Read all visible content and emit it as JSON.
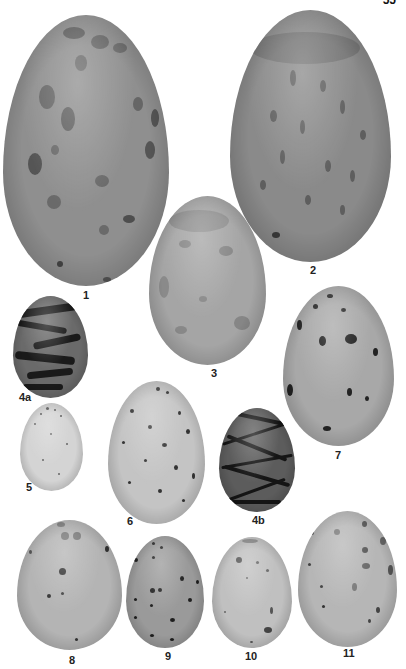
{
  "page": {
    "number_fragment": "55",
    "background": "#ffffff"
  },
  "eggs": [
    {
      "id": "1",
      "label": "1",
      "ground": "#8f8f8f",
      "mark": "#5a5a5a",
      "pattern": "large-blotches"
    },
    {
      "id": "2",
      "label": "2",
      "ground": "#8a8a8a",
      "mark": "#5e5e5e",
      "pattern": "dense-streaks"
    },
    {
      "id": "3",
      "label": "3",
      "ground": "#a5a5a5",
      "mark": "#808080",
      "pattern": "faint-blotches"
    },
    {
      "id": "4a",
      "label": "4a",
      "ground": "#6a6a6a",
      "mark": "#1a1a1a",
      "pattern": "scrawled-dark"
    },
    {
      "id": "5",
      "label": "5",
      "ground": "#d4d4d4",
      "mark": "#555555",
      "pattern": "fine-speckles"
    },
    {
      "id": "6",
      "label": "6",
      "ground": "#c4c4c4",
      "mark": "#333333",
      "pattern": "small-spots"
    },
    {
      "id": "7",
      "label": "7",
      "ground": "#a8a8a8",
      "mark": "#222222",
      "pattern": "sparse-dark-spots"
    },
    {
      "id": "4b",
      "label": "4b",
      "ground": "#5c5c5c",
      "mark": "#151515",
      "pattern": "dense-scrawls"
    },
    {
      "id": "8",
      "label": "8",
      "ground": "#b4b4b4",
      "mark": "#3a3a3a",
      "pattern": "sparse-spots"
    },
    {
      "id": "9",
      "label": "9",
      "ground": "#9a9a9a",
      "mark": "#1e1e1e",
      "pattern": "dark-spots"
    },
    {
      "id": "10",
      "label": "10",
      "ground": "#c0c0c0",
      "mark": "#4a4a4a",
      "pattern": "sparse-spots"
    },
    {
      "id": "11",
      "label": "11",
      "ground": "#b6b6b6",
      "mark": "#4a4a4a",
      "pattern": "mixed-blotches"
    }
  ]
}
